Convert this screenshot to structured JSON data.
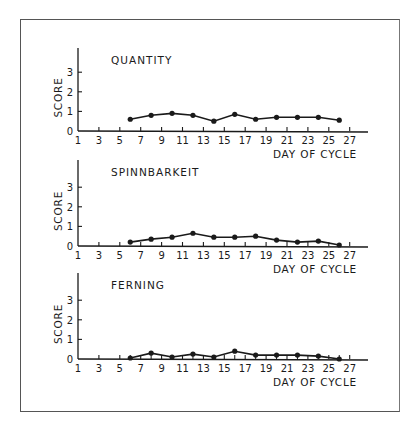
{
  "figure": {
    "x_axis_label": "DAY OF CYCLE",
    "y_axis_label": "SCORE"
  },
  "chart_data": [
    {
      "type": "line",
      "title": "QUANTITY",
      "xlabel": "DAY OF CYCLE",
      "ylabel": "SCORE",
      "x_ticks": [
        1,
        3,
        5,
        7,
        9,
        11,
        13,
        15,
        17,
        19,
        21,
        23,
        25,
        27
      ],
      "y_ticks": [
        0,
        1,
        2,
        3
      ],
      "xlim": [
        1,
        28
      ],
      "ylim": [
        0,
        4
      ],
      "grid": false,
      "x": [
        6,
        8,
        10,
        12,
        14,
        16,
        18,
        20,
        22,
        24,
        26
      ],
      "values": [
        0.6,
        0.8,
        0.9,
        0.8,
        0.5,
        0.85,
        0.6,
        0.7,
        0.7,
        0.7,
        0.55
      ]
    },
    {
      "type": "line",
      "title": "SPINNBARKEIT",
      "xlabel": "DAY OF CYCLE",
      "ylabel": "SCORE",
      "x_ticks": [
        1,
        3,
        5,
        7,
        9,
        11,
        13,
        15,
        17,
        19,
        21,
        23,
        25,
        27
      ],
      "y_ticks": [
        0,
        1,
        2,
        3
      ],
      "xlim": [
        1,
        28
      ],
      "ylim": [
        0,
        4
      ],
      "grid": false,
      "x": [
        6,
        8,
        10,
        12,
        14,
        16,
        18,
        20,
        22,
        24,
        26
      ],
      "values": [
        0.2,
        0.35,
        0.45,
        0.65,
        0.45,
        0.45,
        0.5,
        0.3,
        0.2,
        0.25,
        0.05
      ]
    },
    {
      "type": "line",
      "title": "FERNING",
      "xlabel": "DAY OF CYCLE",
      "ylabel": "SCORE",
      "x_ticks": [
        1,
        3,
        5,
        7,
        9,
        11,
        13,
        15,
        17,
        19,
        21,
        23,
        25,
        27
      ],
      "y_ticks": [
        0,
        1,
        2,
        3
      ],
      "xlim": [
        1,
        28
      ],
      "ylim": [
        0,
        4
      ],
      "grid": false,
      "x": [
        6,
        8,
        10,
        12,
        14,
        16,
        18,
        20,
        22,
        24,
        26
      ],
      "values": [
        0.05,
        0.3,
        0.1,
        0.25,
        0.1,
        0.4,
        0.2,
        0.2,
        0.2,
        0.15,
        0.0
      ]
    }
  ],
  "style": {
    "ink": "#1a1a1a",
    "frame": "#555555",
    "background": "#ffffff"
  }
}
